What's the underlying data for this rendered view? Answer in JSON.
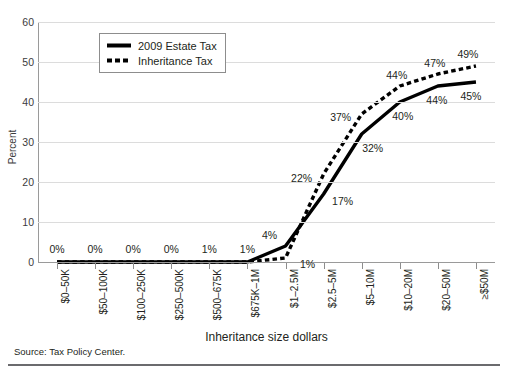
{
  "figure": {
    "clipped_title": "",
    "source_note": "Source: Tax Policy Center."
  },
  "legend": {
    "position": "top-center-inside",
    "items": [
      {
        "label": "2009 Estate Tax",
        "style": "solid"
      },
      {
        "label": "Inheritance Tax",
        "style": "dashed"
      }
    ]
  },
  "chart_data": {
    "type": "line",
    "title": "",
    "xlabel": "Inheritance size dollars",
    "ylabel": "Percent",
    "ylim": [
      0,
      60
    ],
    "yticks": [
      0,
      10,
      20,
      30,
      40,
      50,
      60
    ],
    "grid": true,
    "categories": [
      "$0–50K",
      "$50–100K",
      "$100–250K",
      "$250–500K",
      "$500–675K",
      "$675K–1M",
      "$1–2.5M",
      "$2.5–5M",
      "$5–10M",
      "$10–20M",
      "$20–50M",
      "≥$50M"
    ],
    "series": [
      {
        "name": "2009 Estate Tax",
        "style": "solid",
        "values": [
          0,
          0,
          0,
          0,
          0,
          0,
          4,
          17,
          32,
          40,
          44,
          45
        ],
        "data_labels": [
          "0%",
          "0%",
          "0%",
          "0%",
          "1%",
          "1%",
          "4%",
          "17%",
          "32%",
          "40%",
          "44%",
          "45%"
        ]
      },
      {
        "name": "Inheritance Tax",
        "style": "dashed",
        "values": [
          0,
          0,
          0,
          0,
          0,
          0,
          1,
          22,
          37,
          44,
          47,
          49
        ],
        "data_labels": [
          "",
          "",
          "",
          "",
          "",
          "",
          "1%",
          "22%",
          "37%",
          "44%",
          "47%",
          "49%"
        ]
      }
    ],
    "annotations": [
      {
        "text": "0%",
        "cat_index": 0,
        "value": 0,
        "dx": 0,
        "dy": -13
      },
      {
        "text": "0%",
        "cat_index": 1,
        "value": 0,
        "dx": 0,
        "dy": -13
      },
      {
        "text": "0%",
        "cat_index": 2,
        "value": 0,
        "dx": 0,
        "dy": -13
      },
      {
        "text": "0%",
        "cat_index": 3,
        "value": 0,
        "dx": 0,
        "dy": -13
      },
      {
        "text": "1%",
        "cat_index": 4,
        "value": 0,
        "dx": 0,
        "dy": -13
      },
      {
        "text": "1%",
        "cat_index": 5,
        "value": 0,
        "dx": 0,
        "dy": -13
      },
      {
        "text": "4%",
        "cat_index": 6,
        "value": 4,
        "dx": -16,
        "dy": -11
      },
      {
        "text": "1%",
        "cat_index": 6,
        "value": 1,
        "dx": 22,
        "dy": 6
      },
      {
        "text": "22%",
        "cat_index": 7,
        "value": 22,
        "dx": -22,
        "dy": 4
      },
      {
        "text": "17%",
        "cat_index": 7,
        "value": 17,
        "dx": 19,
        "dy": 7
      },
      {
        "text": "37%",
        "cat_index": 8,
        "value": 37,
        "dx": -21,
        "dy": 3
      },
      {
        "text": "32%",
        "cat_index": 8,
        "value": 32,
        "dx": 11,
        "dy": 14
      },
      {
        "text": "44%",
        "cat_index": 9,
        "value": 44,
        "dx": -3,
        "dy": -11
      },
      {
        "text": "40%",
        "cat_index": 9,
        "value": 40,
        "dx": 3,
        "dy": 14
      },
      {
        "text": "47%",
        "cat_index": 10,
        "value": 47,
        "dx": -3,
        "dy": -11
      },
      {
        "text": "44%",
        "cat_index": 10,
        "value": 44,
        "dx": -1,
        "dy": 14
      },
      {
        "text": "49%",
        "cat_index": 11,
        "value": 49,
        "dx": -8,
        "dy": -12
      },
      {
        "text": "45%",
        "cat_index": 11,
        "value": 45,
        "dx": -5,
        "dy": 14
      }
    ],
    "colors": {
      "line": "#000000",
      "gridline": "#dcdcdc",
      "axis": "#9a9a9a",
      "text": "#231f20",
      "background": "#ffffff"
    }
  }
}
